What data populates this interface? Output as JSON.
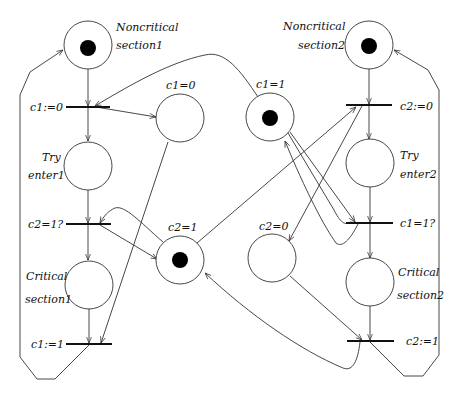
{
  "diagram": {
    "type": "petri-net",
    "places": [
      {
        "id": "nc1",
        "label_lines": [
          "Noncritical",
          "section1"
        ],
        "token": true
      },
      {
        "id": "try1",
        "label_lines": [
          "Try",
          "enter1"
        ],
        "token": false
      },
      {
        "id": "cs1",
        "label_lines": [
          "Critical",
          "section1"
        ],
        "token": false
      },
      {
        "id": "c1_0",
        "label": "c1=0",
        "token": false
      },
      {
        "id": "c1_1",
        "label": "c1=1",
        "token": true
      },
      {
        "id": "c2_1",
        "label": "c2=1",
        "token": true
      },
      {
        "id": "c2_0",
        "label": "c2=0",
        "token": false
      },
      {
        "id": "nc2",
        "label_lines": [
          "Noncritical",
          "section2"
        ],
        "token": true
      },
      {
        "id": "try2",
        "label_lines": [
          "Try",
          "enter2"
        ],
        "token": false
      },
      {
        "id": "cs2",
        "label_lines": [
          "Critical",
          "section2"
        ],
        "token": false
      }
    ],
    "transitions": [
      {
        "id": "t_c1_set0",
        "label": "c1:=0"
      },
      {
        "id": "t_c2_test1",
        "label": "c2=1?"
      },
      {
        "id": "t_c1_set1",
        "label": "c1:=1"
      },
      {
        "id": "t_c2_set0",
        "label": "c2:=0"
      },
      {
        "id": "t_c1_test1",
        "label": "c1=1?"
      },
      {
        "id": "t_c2_set1",
        "label": "c2:=1"
      }
    ],
    "arcs": [
      [
        "nc1",
        "t_c1_set0"
      ],
      [
        "t_c1_set0",
        "try1"
      ],
      [
        "c1_1",
        "t_c1_set0"
      ],
      [
        "t_c1_set0",
        "c1_0"
      ],
      [
        "try1",
        "t_c2_test1"
      ],
      [
        "t_c2_test1",
        "cs1"
      ],
      [
        "c2_1",
        "t_c2_test1"
      ],
      [
        "t_c2_test1",
        "c2_1"
      ],
      [
        "cs1",
        "t_c1_set1"
      ],
      [
        "c1_0",
        "t_c1_set1"
      ],
      [
        "t_c1_set1",
        "nc1"
      ],
      [
        "t_c1_set1",
        "c1_1"
      ],
      [
        "nc2",
        "t_c2_set0"
      ],
      [
        "t_c2_set0",
        "try2"
      ],
      [
        "c2_1",
        "t_c2_set0"
      ],
      [
        "t_c2_set0",
        "c2_0"
      ],
      [
        "try2",
        "t_c1_test1"
      ],
      [
        "t_c1_test1",
        "cs2"
      ],
      [
        "c1_1",
        "t_c1_test1"
      ],
      [
        "t_c1_test1",
        "c1_1"
      ],
      [
        "cs2",
        "t_c2_set1"
      ],
      [
        "c2_0",
        "t_c2_set1"
      ],
      [
        "t_c2_set1",
        "nc2"
      ],
      [
        "t_c2_set1",
        "c2_1"
      ]
    ]
  },
  "labels": {
    "nc1_a": "Noncritical",
    "nc1_b": "section1",
    "nc2_a": "Noncritical",
    "nc2_b": "section2",
    "try1_a": "Try",
    "try1_b": "enter1",
    "try2_a": "Try",
    "try2_b": "enter2",
    "cs1_a": "Critical",
    "cs1_b": "section1",
    "cs2_a": "Critical",
    "cs2_b": "section2",
    "c1_0": "c1=0",
    "c1_1": "c1=1",
    "c2_1": "c2=1",
    "c2_0": "c2=0",
    "t_c1_set0": "c1:=0",
    "t_c2_test1": "c2=1?",
    "t_c1_set1": "c1:=1",
    "t_c2_set0": "c2:=0",
    "t_c1_test1": "c1=1?",
    "t_c2_set1": "c2:=1"
  }
}
